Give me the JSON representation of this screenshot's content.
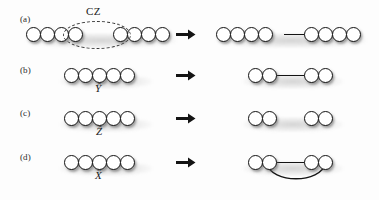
{
  "figure": {
    "type": "diagram",
    "width": 379,
    "height": 200,
    "background_color": "#fdfdfd",
    "node_fill": "#ffffff",
    "node_stroke": "#141414",
    "edge_color": "#141414",
    "dashed_color": "#3a3a3a"
  },
  "rows": [
    {
      "id": "a",
      "label": "(a)",
      "operation": "CZ",
      "operation_style": "upright",
      "arrow": "right-arrow",
      "left": {
        "nodes": 8,
        "edges": [],
        "arcs": [],
        "highlight": {
          "type": "dashed-ellipse",
          "label": "CZ",
          "spans_nodes": [
            4,
            5
          ]
        }
      },
      "right": {
        "nodes": 8,
        "edges": [
          [
            4,
            5
          ]
        ],
        "arcs": []
      }
    },
    {
      "id": "b",
      "label": "(b)",
      "operation": "Ŷ",
      "operation_style": "italic-hat",
      "arrow": "right-arrow",
      "left": {
        "nodes": 5,
        "edges": [],
        "arcs": [],
        "highlight": null
      },
      "right": {
        "nodes": 4,
        "edges": [
          [
            2,
            3
          ]
        ],
        "arcs": []
      }
    },
    {
      "id": "c",
      "label": "(c)",
      "operation": "Ẑ",
      "operation_style": "italic-hat",
      "arrow": "right-arrow",
      "left": {
        "nodes": 5,
        "edges": [],
        "arcs": [],
        "highlight": null
      },
      "right": {
        "nodes": 4,
        "edges": [],
        "arcs": []
      }
    },
    {
      "id": "d",
      "label": "(d)",
      "operation": "X̂",
      "operation_style": "italic-hat",
      "arrow": "right-arrow",
      "left": {
        "nodes": 5,
        "edges": [],
        "arcs": [],
        "highlight": null
      },
      "right": {
        "nodes": 4,
        "edges": [
          [
            2,
            3
          ]
        ],
        "arcs": [
          [
            1,
            4
          ]
        ]
      }
    }
  ],
  "labels": {
    "row_a": "(a)",
    "row_b": "(b)",
    "row_c": "(c)",
    "row_d": "(d)",
    "cz": "CZ",
    "y_hat": "Ŷ",
    "z_hat": "Ẑ",
    "x_hat": "X̂"
  }
}
